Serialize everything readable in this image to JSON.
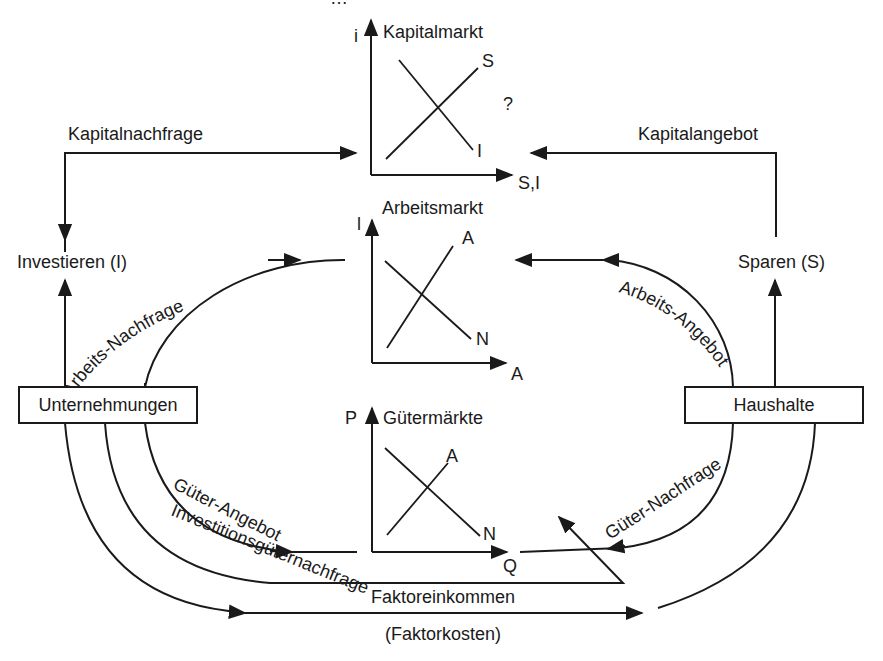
{
  "diagram": {
    "type": "circular-flow-economic-model",
    "top_clipped_text": "…",
    "sectors": {
      "firms": "Unternehmungen",
      "households": "Haushalte"
    },
    "nodes": {
      "invest": "Investieren (I)",
      "save": "Sparen (S)"
    },
    "flows": {
      "capital_demand": "Kapitalnachfrage",
      "capital_supply": "Kapitalangebot",
      "labor_demand": "Arbeits-Nachfrage",
      "labor_supply": "Arbeits-Angebot",
      "goods_supply": "Güter-Angebot",
      "goods_demand": "Güter-Nachfrage",
      "investment_goods_demand": "Investitionsgüternachfrage",
      "factor_income": "Faktoreinkommen",
      "factor_costs": "(Faktorkosten)"
    },
    "markets": [
      {
        "title": "Kapitalmarkt",
        "y_axis": "i",
        "x_axis": "S,I",
        "curve_up": "S",
        "curve_down": "I",
        "annotation": "?"
      },
      {
        "title": "Arbeitsmarkt",
        "y_axis": "l",
        "x_axis": "A",
        "curve_up": "A",
        "curve_down": "N"
      },
      {
        "title": "Gütermärkte",
        "y_axis": "P",
        "x_axis": "Q",
        "curve_up": "A",
        "curve_down": "N"
      }
    ]
  }
}
